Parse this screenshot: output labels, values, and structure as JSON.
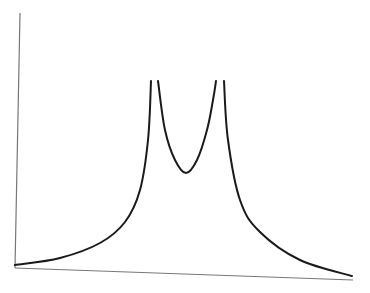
{
  "chart_data": {
    "type": "line",
    "title": "",
    "xlabel": "",
    "ylabel": "",
    "grid": false,
    "legend": null,
    "series": [
      {
        "name": "curve",
        "color": "#1a1a1a",
        "x_px": [
          15,
          60,
          100,
          125,
          140,
          148,
          151,
          158,
          165,
          175,
          186,
          197,
          207,
          213,
          216,
          224,
          228,
          240,
          260,
          300,
          352
        ],
        "y_px": [
          265,
          258,
          243,
          222,
          190,
          140,
          81,
          81,
          130,
          160,
          173,
          160,
          130,
          100,
          81,
          81,
          140,
          200,
          232,
          260,
          276
        ]
      }
    ],
    "axes": {
      "y_axis_px": {
        "top": [
          20,
          13
        ],
        "bottom": [
          15,
          268
        ]
      },
      "x_axis_px": {
        "left": [
          15,
          268
        ],
        "right": [
          353,
          280
        ]
      },
      "color": "#777777"
    }
  }
}
